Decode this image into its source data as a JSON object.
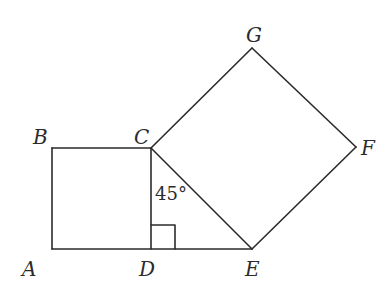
{
  "diagram": {
    "type": "geometry",
    "points": {
      "A": {
        "x": 52,
        "y": 249
      },
      "B": {
        "x": 52,
        "y": 148
      },
      "C": {
        "x": 151,
        "y": 148
      },
      "D": {
        "x": 151,
        "y": 249
      },
      "E": {
        "x": 252,
        "y": 249
      },
      "F": {
        "x": 356,
        "y": 147
      },
      "G": {
        "x": 252,
        "y": 48
      }
    },
    "labels": [
      {
        "id": "A",
        "text": "A",
        "x": 22,
        "y": 276
      },
      {
        "id": "B",
        "text": "B",
        "x": 34,
        "y": 145
      },
      {
        "id": "C",
        "text": "C",
        "x": 134,
        "y": 144
      },
      {
        "id": "D",
        "text": "D",
        "x": 139,
        "y": 276
      },
      {
        "id": "E",
        "text": "E",
        "x": 245,
        "y": 276
      },
      {
        "id": "F",
        "text": "F",
        "x": 360,
        "y": 155
      },
      {
        "id": "G",
        "text": "G",
        "x": 245,
        "y": 42
      }
    ],
    "angle_label": {
      "text": "45°",
      "x": 155,
      "y": 200
    },
    "right_angle_mark": {
      "at": "D",
      "size": 24
    },
    "segments": [
      [
        "A",
        "B"
      ],
      [
        "B",
        "C"
      ],
      [
        "C",
        "D"
      ],
      [
        "A",
        "E"
      ],
      [
        "C",
        "E"
      ],
      [
        "C",
        "G"
      ],
      [
        "G",
        "F"
      ],
      [
        "F",
        "E"
      ]
    ],
    "stroke_color": "#2b2b2b",
    "background": "#ffffff"
  }
}
